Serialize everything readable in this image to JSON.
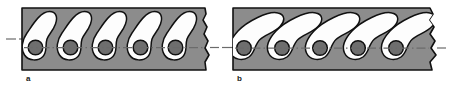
{
  "figure": {
    "caption_labels": {
      "panel_a": "a",
      "panel_b": "b"
    },
    "colors": {
      "background": "#ffffff",
      "matrix_gray": "#8c8c8c",
      "cell_white": "#fdfdfd",
      "inclusion_gray": "#6e6e6e",
      "outline_black": "#111111",
      "centerline_gray": "#6b6b6b"
    },
    "panels": [
      {
        "id": "a",
        "label": "a",
        "cell_count": 5,
        "orientation": "upright-teardrop",
        "block_edge_right": "jagged-break",
        "centerline": "dash-dot horizontal axis",
        "cells": [
          {
            "index": 1,
            "inclusion": "circle"
          },
          {
            "index": 2,
            "inclusion": "circle"
          },
          {
            "index": 3,
            "inclusion": "circle"
          },
          {
            "index": 4,
            "inclusion": "circle"
          },
          {
            "index": 5,
            "inclusion": "circle"
          }
        ]
      },
      {
        "id": "b",
        "label": "b",
        "cell_count": 5,
        "orientation": "tilted-teardrop",
        "block_edge_right": "jagged-break",
        "centerline": "dash-dot horizontal axis",
        "cells": [
          {
            "index": 1,
            "inclusion": "circle"
          },
          {
            "index": 2,
            "inclusion": "circle"
          },
          {
            "index": 3,
            "inclusion": "circle"
          },
          {
            "index": 4,
            "inclusion": "circle"
          },
          {
            "index": 5,
            "inclusion": "circle"
          }
        ]
      }
    ]
  }
}
